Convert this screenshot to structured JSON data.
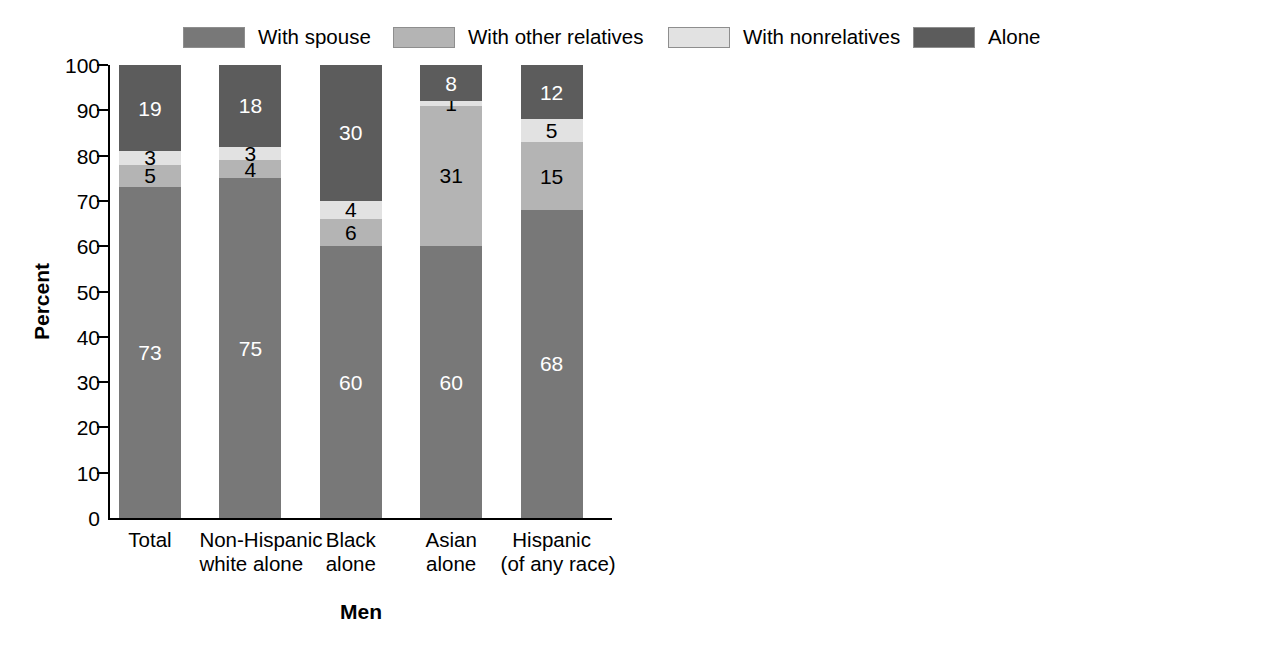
{
  "legend": {
    "items": [
      {
        "label": "With spouse",
        "key": "spouse",
        "color": "#787878",
        "x": 183
      },
      {
        "label": "With other relatives",
        "key": "other",
        "color": "#b4b4b4",
        "x": 393
      },
      {
        "label": "With nonrelatives",
        "key": "nonrel",
        "color": "#e2e2e2",
        "x": 668
      },
      {
        "label": "Alone",
        "key": "alone",
        "color": "#5c5c5c",
        "x": 913
      }
    ]
  },
  "axis": {
    "ylabel": "Percent",
    "yticks": [
      "100",
      "90",
      "80",
      "70",
      "60",
      "50",
      "40",
      "30",
      "20",
      "10",
      "0"
    ],
    "ymin": 0,
    "ymax": 100
  },
  "categories": [
    {
      "l1": "Total",
      "l2": ""
    },
    {
      "l1": "Non-Hispanic",
      "l2": "white alone"
    },
    {
      "l1": "Black",
      "l2": "alone"
    },
    {
      "l1": "Asian",
      "l2": "alone"
    },
    {
      "l1": "Hispanic",
      "l2": "(of any race)"
    }
  ],
  "panels": [
    {
      "id": "men",
      "title": "Men"
    },
    {
      "id": "women",
      "title": "Women"
    }
  ],
  "chart_data": {
    "type": "bar",
    "subtype": "stacked-bar",
    "title": "",
    "xlabel": "",
    "ylabel": "Percent",
    "ylim": [
      0,
      100
    ],
    "grid": false,
    "legend_position": "top",
    "categories": [
      "Total",
      "Non-Hispanic white alone",
      "Black alone",
      "Asian alone",
      "Hispanic (of any race)"
    ],
    "panels": [
      {
        "name": "Men",
        "series": [
          {
            "name": "With spouse",
            "values": [
              73,
              75,
              60,
              60,
              68
            ]
          },
          {
            "name": "With other relatives",
            "values": [
              5,
              4,
              6,
              31,
              15
            ]
          },
          {
            "name": "With nonrelatives",
            "values": [
              3,
              3,
              4,
              1,
              5
            ]
          },
          {
            "name": "Alone",
            "values": [
              19,
              18,
              30,
              8,
              12
            ]
          }
        ]
      },
      {
        "name": "Women",
        "series": [
          {
            "name": "With spouse",
            "values": [
              49,
              49,
              46,
              43,
              51
            ]
          },
          {
            "name": "With other relatives",
            "values": [
              9,
              7,
              13,
              36,
              25
            ]
          },
          {
            "name": "With nonrelatives",
            "values": [
              2,
              2,
              2,
              2,
              2
            ]
          },
          {
            "name": "Alone",
            "values": [
              40,
              42,
              39,
              19,
              22
            ]
          }
        ]
      }
    ]
  }
}
